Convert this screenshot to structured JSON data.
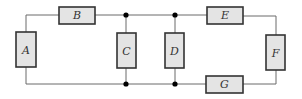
{
  "diagram": {
    "type": "circuit",
    "colors": {
      "wire": "#6a6a6a",
      "component_fill": "#e4e4e4",
      "component_stroke": "#333333",
      "node": "#000000",
      "label": "#333333"
    },
    "components": [
      {
        "id": "A",
        "label": "A",
        "orientation": "vertical"
      },
      {
        "id": "B",
        "label": "B",
        "orientation": "horizontal"
      },
      {
        "id": "C",
        "label": "C",
        "orientation": "vertical"
      },
      {
        "id": "D",
        "label": "D",
        "orientation": "vertical"
      },
      {
        "id": "E",
        "label": "E",
        "orientation": "horizontal"
      },
      {
        "id": "F",
        "label": "F",
        "orientation": "vertical"
      },
      {
        "id": "G",
        "label": "G",
        "orientation": "horizontal"
      }
    ],
    "junction_nodes": 4
  }
}
